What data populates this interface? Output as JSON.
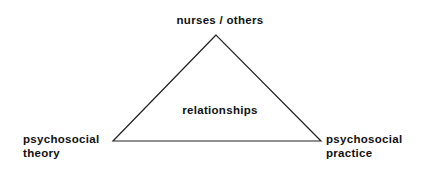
{
  "diagram": {
    "type": "triangle",
    "nodes": {
      "top": {
        "label": "nurses / others"
      },
      "left": {
        "lines": [
          "psychosocial",
          "theory"
        ]
      },
      "right": {
        "lines": [
          "psychosocial",
          "practice"
        ]
      }
    },
    "center": {
      "label": "relationships"
    },
    "edges": [
      {
        "from": "top",
        "to": "left"
      },
      {
        "from": "top",
        "to": "right"
      },
      {
        "from": "left",
        "to": "right"
      }
    ],
    "colors": {
      "line": "#222222",
      "text": "#111111",
      "background": "#ffffff"
    }
  }
}
